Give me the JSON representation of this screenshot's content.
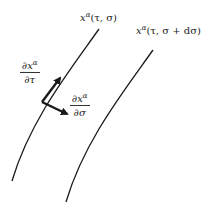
{
  "diagram": {
    "curves": [
      {
        "id": "worldsheet-curve-1",
        "label": "x^α(τ,σ)",
        "label_base": "x",
        "label_sup": "α",
        "label_args": "(τ, σ)"
      },
      {
        "id": "worldsheet-curve-2",
        "label": "x^α(τ,σ+dσ)",
        "label_base": "x",
        "label_sup": "α",
        "label_args": "(τ, σ + dσ)"
      }
    ],
    "vectors": [
      {
        "id": "tangent-tau",
        "numerator_base": "∂x",
        "numerator_sup": "α",
        "denominator": "∂τ"
      },
      {
        "id": "tangent-sigma",
        "numerator_base": "∂x",
        "numerator_sup": "α",
        "denominator": "∂σ"
      }
    ],
    "colors": {
      "stroke": "#1a1a1a",
      "background": "#ffffff"
    }
  }
}
